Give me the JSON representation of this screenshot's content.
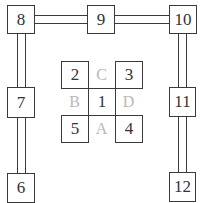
{
  "diagram": {
    "outer_boxes": [
      {
        "id": "8",
        "label": "8",
        "position": "top-left"
      },
      {
        "id": "9",
        "label": "9",
        "position": "top-center"
      },
      {
        "id": "10",
        "label": "10",
        "position": "top-right"
      },
      {
        "id": "7",
        "label": "7",
        "position": "middle-left"
      },
      {
        "id": "11",
        "label": "11",
        "position": "middle-right"
      },
      {
        "id": "6",
        "label": "6",
        "position": "bottom-left"
      },
      {
        "id": "12",
        "label": "12",
        "position": "bottom-right"
      }
    ],
    "center_boxes": [
      {
        "id": "2",
        "label": "2"
      },
      {
        "id": "3",
        "label": "3"
      },
      {
        "id": "1",
        "label": "1"
      },
      {
        "id": "5",
        "label": "5"
      },
      {
        "id": "4",
        "label": "4"
      }
    ],
    "center_letters": [
      {
        "id": "C",
        "label": "C",
        "position": "top"
      },
      {
        "id": "B",
        "label": "B",
        "position": "left"
      },
      {
        "id": "D",
        "label": "D",
        "position": "right"
      },
      {
        "id": "A",
        "label": "A",
        "position": "bottom"
      }
    ],
    "connections": [
      {
        "from": "8",
        "to": "9",
        "style": "double-line"
      },
      {
        "from": "9",
        "to": "10",
        "style": "double-line"
      },
      {
        "from": "8",
        "to": "7",
        "style": "double-line"
      },
      {
        "from": "7",
        "to": "6",
        "style": "double-line"
      },
      {
        "from": "10",
        "to": "11",
        "style": "double-line"
      },
      {
        "from": "11",
        "to": "12",
        "style": "double-line"
      }
    ],
    "colors": {
      "line": "#3a3a3a",
      "box_text": "#333333",
      "letter_text": "#b8b8b8",
      "background": "#ffffff"
    }
  }
}
